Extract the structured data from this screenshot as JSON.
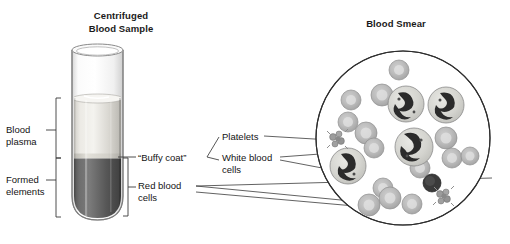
{
  "figure": {
    "panels": [
      {
        "id": "centrifuged",
        "title": "Centrifuged\nBlood Sample"
      },
      {
        "id": "smear",
        "title": "Blood Smear"
      }
    ]
  },
  "labels": {
    "blood_plasma": "Blood\nplasma",
    "formed_elements": "Formed\nelements",
    "buffy_coat": "“Buffy coat”",
    "red_blood_cells_tube": "Red blood\ncells",
    "platelets": "Platelets",
    "white_blood_cells": "White blood\ncells"
  },
  "colors": {
    "ink": "#141414",
    "line": "#3a3a3a",
    "glass": "#f2f2f2",
    "glass_edge": "#9a9a9a",
    "plasma_light": "#e6e4df",
    "plasma_dark": "#b9b7b1",
    "buffy": "#cfcdc6",
    "rbc_layer_light": "#6d6d6d",
    "rbc_layer_dark": "#454545",
    "cell_fill": "#b9b9b9",
    "cell_edge": "#8c8c8c",
    "wbc_fill": "#d8d8d4",
    "nucleus": "#2b2b2b",
    "platelet": "#9c9c9c",
    "circle_edge": "#2e2e2e"
  },
  "tube": {
    "plasma_fraction_label": "Blood plasma",
    "formed_fraction_label": "Formed elements",
    "rim_top_y": 48,
    "plasma_top_y": 98,
    "buffy_y": 158,
    "bottom_y": 218
  },
  "smear": {
    "circle": {
      "cx": 403,
      "cy": 138,
      "r": 87
    },
    "red_blood_cells": [
      {
        "cx": 399,
        "cy": 70,
        "r": 10
      },
      {
        "cx": 351,
        "cy": 100,
        "r": 10
      },
      {
        "cx": 382,
        "cy": 95,
        "r": 11
      },
      {
        "cx": 348,
        "cy": 122,
        "r": 10
      },
      {
        "cx": 366,
        "cy": 133,
        "r": 11
      },
      {
        "cx": 374,
        "cy": 148,
        "r": 10
      },
      {
        "cx": 446,
        "cy": 138,
        "r": 11
      },
      {
        "cx": 452,
        "cy": 158,
        "r": 10
      },
      {
        "cx": 470,
        "cy": 156,
        "r": 9
      },
      {
        "cx": 420,
        "cy": 168,
        "r": 10
      },
      {
        "cx": 383,
        "cy": 188,
        "r": 10
      },
      {
        "cx": 390,
        "cy": 198,
        "r": 11
      },
      {
        "cx": 369,
        "cy": 205,
        "r": 11
      },
      {
        "cx": 412,
        "cy": 204,
        "r": 10
      }
    ],
    "white_blood_cells": [
      {
        "cx": 406,
        "cy": 104,
        "r": 18,
        "type": "neutrophil"
      },
      {
        "cx": 446,
        "cy": 105,
        "r": 18,
        "type": "neutrophil"
      },
      {
        "cx": 414,
        "cy": 147,
        "r": 19,
        "type": "monocyte"
      },
      {
        "cx": 348,
        "cy": 166,
        "r": 18,
        "type": "neutrophil"
      },
      {
        "cx": 432,
        "cy": 183,
        "r": 9,
        "type": "lymphocyte"
      }
    ],
    "platelet_clusters": [
      {
        "cx": 337,
        "cy": 140
      },
      {
        "cx": 443,
        "cy": 196
      }
    ]
  }
}
